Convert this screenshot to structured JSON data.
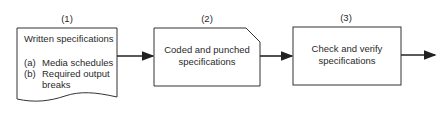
{
  "steps": [
    {
      "number": "(1)",
      "title": "Written specifications",
      "items": [
        {
          "marker": "(a)",
          "text": "Media schedules"
        },
        {
          "marker": "(b)",
          "text": "Required output"
        },
        {
          "marker": "",
          "text": "breaks"
        }
      ],
      "shape": "document"
    },
    {
      "number": "(2)",
      "line1": "Coded and punched",
      "line2": "specifications",
      "shape": "punched-card"
    },
    {
      "number": "(3)",
      "line1": "Check and verify",
      "line2": "specifications",
      "shape": "process"
    }
  ],
  "colors": {
    "stroke": "#333333",
    "text": "#2a2a2a",
    "background": "#ffffff"
  }
}
